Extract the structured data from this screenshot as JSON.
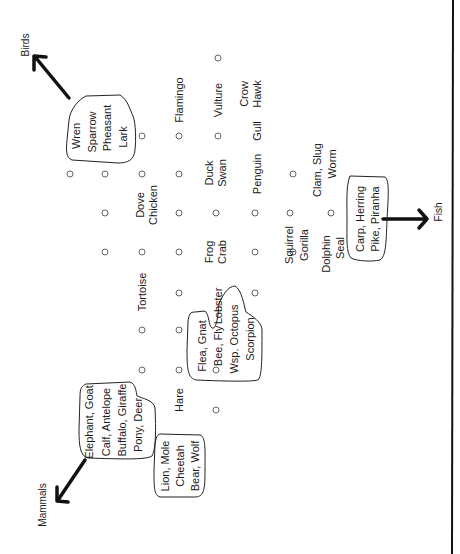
{
  "categories": {
    "birds": "Birds",
    "mammals": "Mammals",
    "fish": "Fish"
  },
  "groups": {
    "birds_cluster": [
      "Wren",
      "Sparrow",
      "Pheasant",
      "Lark"
    ],
    "mammals_large": [
      "Elephant, Goat",
      "Calf, Antelope",
      "Buffalo, Giraffe",
      "Pony, Deer"
    ],
    "mammals_predators": [
      "Lion, Mole",
      "Cheetah",
      "Bear, Wolf"
    ],
    "invertebrates": [
      "Flea, Gnat",
      "Bee, Fly",
      "Wsp. Octopus",
      "Scorpion"
    ],
    "fish_cluster": [
      "Carp, Herring",
      "Pike, Piranha"
    ]
  },
  "labels": {
    "flamingo": "Flamingo",
    "vulture": "Vulture",
    "crow": "Crow",
    "hawk": "Hawk",
    "gull": "Gull",
    "penguin": "Penguin",
    "duck": "Duck",
    "swan": "Swan",
    "dove": "Dove",
    "chicken": "Chicken",
    "tortoise": "Tortoise",
    "frog": "Frog",
    "crab": "Crab",
    "lobster": "Lobster",
    "squirrel": "Squirrel",
    "gorilla": "Gorilla",
    "dolphin": "Dolphin",
    "seal": "Seal",
    "clam_slug": "Clam, Slug",
    "worm": "Worm",
    "hare": "Hare"
  }
}
